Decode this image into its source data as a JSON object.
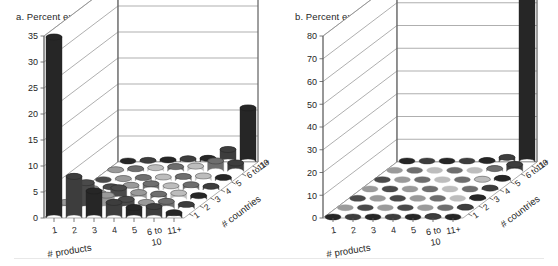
{
  "figure": {
    "panels": [
      {
        "id": "a",
        "title": "a. Percent exporting firms",
        "chart_index": 0
      },
      {
        "id": "b",
        "title": "b. Percent export value",
        "chart_index": 1
      }
    ]
  },
  "chart_data": [
    {
      "type": "bar",
      "subtype": "3d-cylinder-surface",
      "title": "a. Percent exporting firms",
      "xlabel": "# products",
      "zlabel": "# countries",
      "ylabel": "",
      "categories": [
        "1",
        "2",
        "3",
        "4",
        "5",
        "6 to 10",
        "11+"
      ],
      "depth_categories": [
        "1",
        "2",
        "3",
        "4",
        "5",
        "6 to 10",
        "11+"
      ],
      "ylim": [
        0,
        35
      ],
      "yticks": [
        0,
        5,
        10,
        15,
        20,
        25,
        30,
        35
      ],
      "grid": true,
      "legend": "none",
      "note": "values[depth_index][product_index]; depth_index 0 = '1 country' (front row)",
      "values": [
        [
          34.8,
          8.0,
          5.2,
          3.0,
          2.0,
          2.2,
          1.0
        ],
        [
          1.2,
          5.0,
          2.6,
          1.8,
          1.2,
          1.4,
          0.8
        ],
        [
          0.5,
          1.2,
          2.2,
          1.3,
          1.0,
          1.2,
          0.7
        ],
        [
          0.3,
          0.6,
          0.9,
          1.2,
          0.8,
          1.0,
          0.7
        ],
        [
          0.2,
          0.4,
          0.6,
          0.7,
          0.8,
          0.9,
          0.6
        ],
        [
          0.3,
          0.5,
          0.7,
          0.9,
          1.0,
          2.0,
          1.6
        ],
        [
          0.2,
          0.3,
          0.4,
          0.6,
          0.7,
          2.4,
          10.4
        ]
      ]
    },
    {
      "type": "bar",
      "subtype": "3d-cylinder-surface",
      "title": "b. Percent export value",
      "xlabel": "# products",
      "zlabel": "# countries",
      "ylabel": "",
      "categories": [
        "1",
        "2",
        "3",
        "4",
        "5",
        "6 to 10",
        "11+"
      ],
      "depth_categories": [
        "1",
        "2",
        "3",
        "4",
        "5",
        "6 to 10",
        "11+"
      ],
      "ylim": [
        0,
        80
      ],
      "yticks": [
        0,
        10,
        20,
        30,
        40,
        50,
        60,
        70,
        80
      ],
      "grid": true,
      "legend": "none",
      "note": "values[depth_index][product_index]; depth_index 0 = '1 country' (front row)",
      "values": [
        [
          0.4,
          0.5,
          0.4,
          0.4,
          0.3,
          0.6,
          0.5
        ],
        [
          0.3,
          0.4,
          0.4,
          0.3,
          0.3,
          0.5,
          0.6
        ],
        [
          0.2,
          0.3,
          0.3,
          0.3,
          0.3,
          0.5,
          0.7
        ],
        [
          0.2,
          0.2,
          0.3,
          0.3,
          0.3,
          0.5,
          0.8
        ],
        [
          0.2,
          0.2,
          0.2,
          0.3,
          0.3,
          0.6,
          1.0
        ],
        [
          0.2,
          0.3,
          0.3,
          0.4,
          0.5,
          1.2,
          3.0
        ],
        [
          0.2,
          0.3,
          0.3,
          0.4,
          0.6,
          2.0,
          80.5
        ]
      ]
    }
  ],
  "colors": {
    "bar_dark": "#262626",
    "bar_mid": "#6e6e6e",
    "bar_light": "#bdbdbd",
    "grid": "#8c8c8c",
    "axis": "#595959",
    "text": "#262626",
    "background": "#ffffff"
  }
}
